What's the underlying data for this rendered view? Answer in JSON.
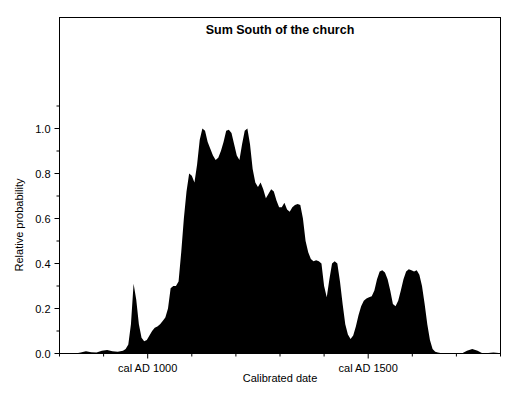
{
  "chart_data": {
    "type": "area",
    "title": "Sum South of the church",
    "xlabel": "Calibrated date",
    "ylabel": "Relative probability",
    "grid": false,
    "legend": null,
    "xlim": [
      800,
      1800
    ],
    "ylim": [
      0.0,
      1.08
    ],
    "x_tick_labels": [
      "cal AD 1000",
      "cal AD 1500"
    ],
    "x_tick_values": [
      1000,
      1500
    ],
    "x_minor_tick_values": [
      800,
      900,
      1100,
      1200,
      1300,
      1400,
      1600,
      1700,
      1800
    ],
    "y_tick_labels": [
      "0.0",
      "0.2",
      "0.4",
      "0.6",
      "0.8",
      "1.0"
    ],
    "y_tick_values": [
      0.0,
      0.2,
      0.4,
      0.6,
      0.8,
      1.0
    ],
    "y_minor_tick_values": [
      0.1,
      0.3,
      0.5,
      0.7,
      0.9,
      1.1
    ],
    "series_name": "Summed probability",
    "fill_color": "#000000",
    "x": [
      800,
      812,
      824,
      836,
      848,
      860,
      872,
      884,
      896,
      908,
      920,
      932,
      944,
      950,
      956,
      962,
      968,
      974,
      980,
      986,
      992,
      998,
      1004,
      1010,
      1016,
      1022,
      1028,
      1034,
      1040,
      1046,
      1052,
      1058,
      1064,
      1070,
      1076,
      1082,
      1088,
      1094,
      1100,
      1106,
      1112,
      1118,
      1124,
      1130,
      1136,
      1142,
      1148,
      1154,
      1160,
      1166,
      1172,
      1178,
      1184,
      1190,
      1196,
      1202,
      1208,
      1214,
      1220,
      1226,
      1232,
      1238,
      1244,
      1250,
      1256,
      1262,
      1268,
      1274,
      1280,
      1286,
      1292,
      1298,
      1304,
      1310,
      1316,
      1322,
      1328,
      1334,
      1340,
      1346,
      1352,
      1358,
      1364,
      1370,
      1376,
      1382,
      1388,
      1394,
      1400,
      1406,
      1412,
      1418,
      1424,
      1430,
      1436,
      1442,
      1448,
      1454,
      1460,
      1466,
      1472,
      1478,
      1484,
      1490,
      1496,
      1502,
      1508,
      1514,
      1520,
      1526,
      1532,
      1538,
      1544,
      1550,
      1556,
      1562,
      1568,
      1574,
      1580,
      1586,
      1592,
      1598,
      1604,
      1610,
      1616,
      1622,
      1628,
      1634,
      1640,
      1646,
      1652,
      1658,
      1664,
      1670,
      1676,
      1682,
      1688,
      1694,
      1700,
      1712,
      1724,
      1736,
      1748,
      1760,
      1772,
      1784,
      1796
    ],
    "y": [
      0.0,
      0.0,
      0.0,
      0.0,
      0.004,
      0.01,
      0.006,
      0.004,
      0.012,
      0.016,
      0.01,
      0.008,
      0.012,
      0.02,
      0.04,
      0.13,
      0.31,
      0.24,
      0.13,
      0.07,
      0.055,
      0.06,
      0.08,
      0.1,
      0.115,
      0.12,
      0.13,
      0.145,
      0.16,
      0.2,
      0.29,
      0.3,
      0.3,
      0.32,
      0.45,
      0.6,
      0.72,
      0.8,
      0.79,
      0.76,
      0.84,
      0.95,
      1.0,
      0.99,
      0.94,
      0.91,
      0.88,
      0.86,
      0.87,
      0.9,
      0.94,
      0.99,
      0.995,
      0.98,
      0.93,
      0.88,
      0.86,
      0.93,
      0.99,
      1.0,
      0.93,
      0.82,
      0.76,
      0.74,
      0.76,
      0.73,
      0.69,
      0.71,
      0.73,
      0.72,
      0.68,
      0.65,
      0.65,
      0.67,
      0.64,
      0.63,
      0.65,
      0.66,
      0.665,
      0.66,
      0.6,
      0.5,
      0.45,
      0.42,
      0.41,
      0.415,
      0.41,
      0.4,
      0.3,
      0.25,
      0.33,
      0.4,
      0.41,
      0.4,
      0.32,
      0.22,
      0.13,
      0.085,
      0.065,
      0.08,
      0.12,
      0.17,
      0.21,
      0.235,
      0.245,
      0.25,
      0.255,
      0.28,
      0.33,
      0.365,
      0.37,
      0.36,
      0.33,
      0.28,
      0.22,
      0.21,
      0.235,
      0.28,
      0.33,
      0.365,
      0.375,
      0.37,
      0.365,
      0.37,
      0.35,
      0.3,
      0.22,
      0.13,
      0.06,
      0.02,
      0.008,
      0.004,
      0.002,
      0.001,
      0.0,
      0.0,
      0.0,
      0.0,
      0.0,
      0.0,
      0.012,
      0.02,
      0.012,
      0.0,
      0.002,
      0.004,
      0.002,
      0.0
    ]
  }
}
